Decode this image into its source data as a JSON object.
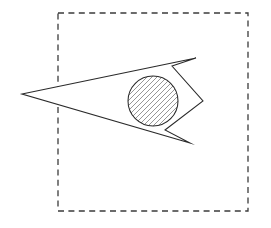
{
  "figure": {
    "title": "Hatched circle inscribed in a notched wedge within a dashed boundary",
    "canvas": {
      "width": 271,
      "height": 228,
      "background_color": "#ffffff"
    },
    "boundary": {
      "name": "dashed-boundary-rectangle",
      "shape": "rectangle",
      "x": 58,
      "y": 13,
      "width": 190,
      "height": 198,
      "stroke_color": "#3b3b3b",
      "stroke_width": 1.3,
      "dash_length": 6,
      "gap_length": 4.4,
      "fill": "none"
    },
    "wedge": {
      "name": "notched-wedge-polygon",
      "shape": "polygon",
      "stroke_color": "#2a2a2a",
      "stroke_width": 1.05,
      "fill_color": "#ffffff",
      "points": "22,94 196,58 172,66 203,101 165,130 190,143",
      "vertices": [
        {
          "label": "left-apex",
          "x": 22,
          "y": 94
        },
        {
          "label": "top-right-apex",
          "x": 196,
          "y": 58
        },
        {
          "label": "upper-notch-inner",
          "x": 172,
          "y": 66
        },
        {
          "label": "right-point",
          "x": 203,
          "y": 101
        },
        {
          "label": "lower-notch-inner",
          "x": 165,
          "y": 130
        },
        {
          "label": "bottom-right-apex",
          "x": 190,
          "y": 143
        }
      ]
    },
    "circle": {
      "name": "hatched-circle",
      "shape": "circle",
      "cx": 153,
      "cy": 101,
      "r": 25,
      "stroke_color": "#2a2a2a",
      "stroke_width": 1.05,
      "fill_color": "#ffffff",
      "hatch": {
        "pattern": "diagonal-lines",
        "angle_degrees": 45,
        "direction": "lower-left-to-upper-right",
        "spacing": 5,
        "stroke_color": "#555555",
        "stroke_width": 0.62
      }
    }
  }
}
